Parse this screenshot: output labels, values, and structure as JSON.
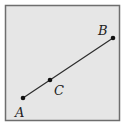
{
  "diagram": {
    "frame": {
      "x": 5,
      "y": 5,
      "width": 115,
      "height": 116,
      "fill": "#e6e6e6",
      "stroke": "#6e6e6e"
    },
    "segment": {
      "from": "A",
      "to": "B",
      "color": "#2a2a2a"
    },
    "points": [
      {
        "id": "A",
        "label": "A",
        "x": 23,
        "y": 98,
        "label_x": 15,
        "label_y": 117
      },
      {
        "id": "C",
        "label": "C",
        "x": 50,
        "y": 80,
        "label_x": 54,
        "label_y": 95
      },
      {
        "id": "B",
        "label": "B",
        "x": 113,
        "y": 38,
        "label_x": 98,
        "label_y": 35
      }
    ]
  }
}
